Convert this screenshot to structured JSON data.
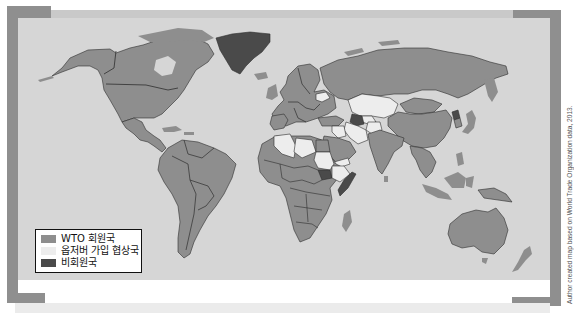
{
  "map": {
    "subject": "WTO membership status world map",
    "colors": {
      "ocean": "#d6d6d6",
      "member": "#8e8e8e",
      "observer": "#ededed",
      "non_member": "#4a4a4a",
      "frame": "#8f8f8f"
    },
    "legend": {
      "items": [
        {
          "label": "WTO 회원국",
          "category": "member",
          "color": "#8e8e8e"
        },
        {
          "label": "옵저버 가입 협상국",
          "category": "observer",
          "color": "#ededed"
        },
        {
          "label": "비회원국",
          "category": "non_member",
          "color": "#4a4a4a"
        }
      ]
    },
    "regions": {
      "member": [
        "North America",
        "Central America",
        "South America",
        "Europe",
        "Russia",
        "China",
        "India",
        "Southeast Asia",
        "Australia",
        "New Zealand",
        "Most of Africa",
        "Japan",
        "Saudi Arabia",
        "Mongolia"
      ],
      "observer": [
        "Algeria",
        "Libya",
        "Sudan",
        "Ethiopia",
        "Kazakhstan",
        "Uzbekistan",
        "Iran",
        "Iraq",
        "Afghanistan",
        "Belarus",
        "Azerbaijan",
        "Yemen",
        "Lebanon",
        "Bosnia and Herzegovina",
        "Serbia"
      ],
      "non_member": [
        "Greenland",
        "South Sudan",
        "Turkmenistan",
        "Eritrea",
        "North Korea",
        "Somalia"
      ]
    },
    "credit": "Author created map based on World Trade Organization data, 2013."
  }
}
